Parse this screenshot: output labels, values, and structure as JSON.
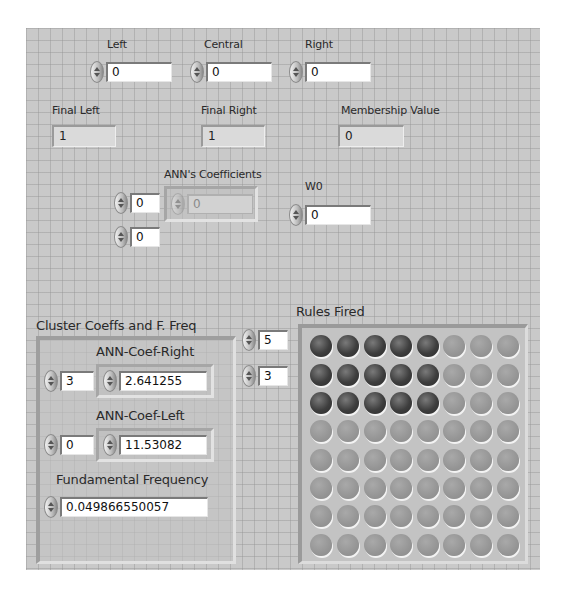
{
  "inputs": {
    "left": {
      "label": "Left",
      "value": "0"
    },
    "central": {
      "label": "Central",
      "value": "0"
    },
    "right": {
      "label": "Right",
      "value": "0"
    }
  },
  "indicators": {
    "final_left": {
      "label": "Final Left",
      "value": "1"
    },
    "final_right": {
      "label": "Final Right",
      "value": "1"
    },
    "membership_value": {
      "label": "Membership Value",
      "value": "0"
    }
  },
  "ann_coefficients": {
    "label": "ANN's Coefficients",
    "index_row": "0",
    "index_col": "0",
    "element_value": "0"
  },
  "w0": {
    "label": "W0",
    "value": "0"
  },
  "cluster": {
    "label": "Cluster Coeffs and F. Freq",
    "ann_coef_right": {
      "label": "ANN-Coef-Right",
      "index": "3",
      "value": "2.641255"
    },
    "ann_coef_left": {
      "label": "ANN-Coef-Left",
      "index": "0",
      "value": "11.53082"
    },
    "fundamental_frequency": {
      "label": "Fundamental Frequency",
      "value": "0.049866550057"
    }
  },
  "rules_fired": {
    "label": "Rules Fired",
    "index_row": "5",
    "index_col": "3",
    "rows": 8,
    "cols": 8,
    "on_color": "#3a3a3a",
    "off_color": "#969696",
    "leds": [
      [
        1,
        1,
        1,
        1,
        1,
        0,
        0,
        0
      ],
      [
        1,
        1,
        1,
        1,
        1,
        0,
        0,
        0
      ],
      [
        1,
        1,
        1,
        1,
        1,
        0,
        0,
        0
      ],
      [
        0,
        0,
        0,
        0,
        0,
        0,
        0,
        0
      ],
      [
        0,
        0,
        0,
        0,
        0,
        0,
        0,
        0
      ],
      [
        0,
        0,
        0,
        0,
        0,
        0,
        0,
        0
      ],
      [
        0,
        0,
        0,
        0,
        0,
        0,
        0,
        0
      ],
      [
        0,
        0,
        0,
        0,
        0,
        0,
        0,
        0
      ]
    ]
  }
}
